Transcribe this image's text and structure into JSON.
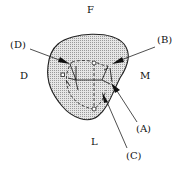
{
  "diagram": {
    "orientation_labels": {
      "top": "F",
      "left": "D",
      "right": "M",
      "bottom": "L"
    },
    "callouts": {
      "a": "(A)",
      "b": "(B)",
      "c": "(C)",
      "d": "(D)"
    },
    "colors": {
      "fill": "#d9d9d9",
      "stroke": "#222222",
      "background": "#ffffff"
    }
  }
}
